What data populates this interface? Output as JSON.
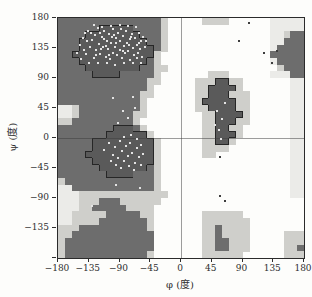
{
  "figure": {
    "kind": "Ramachandran plot (protein backbone dihedral angle map)"
  },
  "chart_data": {
    "type": "heatmap",
    "xlabel": "φ (度)",
    "ylabel": "ψ (度)",
    "xlim": [
      -180,
      180
    ],
    "ylim": [
      -180,
      180
    ],
    "cell_size_deg": 10,
    "xticks": [
      -180,
      -135,
      -90,
      -45,
      0,
      45,
      90,
      135,
      180
    ],
    "xtick_labels": [
      "−180",
      "−135",
      "−90",
      "−45",
      "0",
      "45",
      "90",
      "135",
      "180"
    ],
    "yticks": [
      180,
      135,
      90,
      45,
      0,
      -45,
      -90,
      -135,
      -180
    ],
    "ytick_labels": [
      "180",
      "135",
      "90",
      "45",
      "0",
      "−45",
      "−90",
      "−135",
      ""
    ],
    "grid": "zero-axis lines only",
    "axis_color": "#2b2b2b",
    "zero_line_color": "rgba(60,60,60,0.5)",
    "region_levels": {
      "c": {
        "name": "core-most-favoured",
        "color": "#5a5a5a",
        "outline": "#262626"
      },
      "d": {
        "name": "allowed",
        "color": "#6d6d6d"
      },
      "l": {
        "name": "generously-allowed",
        "color": "#cfcfcb"
      },
      "e": {
        "name": "marginal",
        "color": "#ebebe8"
      },
      ".": {
        "name": "disallowed",
        "color": "#fdfdfb"
      }
    },
    "region_map": [
      "dddddddddddddddl.....llll......eeeee",
      "ddddddcccccddddl...............eeeee",
      "ddddccccccccdddl...............eeldd",
      "dddccccccccccddl...............eeddd",
      "dddcccccccccccdl...............edddd",
      "ddccccccccccccl................ddddd",
      "dddccccccccccdl................edddd",
      "ddddccccccccddll................lddd",
      "dddddccccdddddl.......lll......eeedd",
      "dddddddddddddll.....lllccll.......ee",
      "dddddddddddddl......llccccl.......ee",
      "ddddddddddddll......llccclll......ee",
      "ddddddddddddl.......lcccccll......ee",
      "eeldddddddddl.......llccccll......ee",
      "eelddddddddll........llccccl......ee",
      "lldddddddddl.........llcccll......ee",
      "ddddddddcccdl........llccll.......ee",
      "dddddddccccccl.......llcccl.......ee",
      "dddddcccccccccl......llccl........ee",
      "dddddcccccccccl......llll.........ee",
      "ddddccccccccccl......ll...........ee",
      "dddddcccccccccl...................ee",
      "ddddddcccccccdl...................ee",
      "dddddddccccdddl...................ee",
      "ldddddddddddddl...................ee",
      "eeddddddddddddl...................ee",
      "eeelllllllllllll..................ee",
      "eeellldddllllll.....................",
      "eeelldddddllll......................",
      "eellllldddddll.......llllll.........",
      "eelllldddddddl.......lllllll........",
      "lllddddddddddl.......lldllll........",
      "lldddddddddddd.......lldllll.....lll",
      "lddddddddddddd.......llddlll.....lll",
      "lddddddddddddd.......llddlll.....lld",
      "lddddddddddddl.......llllll......lll"
    ],
    "points": {
      "marker_size_px": 2,
      "on_dark_color": "#e3e3e3",
      "on_light_color": "#3d3d3d",
      "on_dark": [
        [
          -152,
          128
        ],
        [
          -148,
          139
        ],
        [
          -143,
          150
        ],
        [
          -139,
          126
        ],
        [
          -136,
          160
        ],
        [
          -133,
          136
        ],
        [
          -130,
          147
        ],
        [
          -128,
          120
        ],
        [
          -126,
          154
        ],
        [
          -124,
          132
        ],
        [
          -122,
          165
        ],
        [
          -120,
          141
        ],
        [
          -118,
          126
        ],
        [
          -116,
          152
        ],
        [
          -114,
          136
        ],
        [
          -112,
          160
        ],
        [
          -110,
          122
        ],
        [
          -109,
          146
        ],
        [
          -107,
          133
        ],
        [
          -105,
          156
        ],
        [
          -104,
          118
        ],
        [
          -102,
          142
        ],
        [
          -100,
          128
        ],
        [
          -99,
          163
        ],
        [
          -97,
          137
        ],
        [
          -95,
          150
        ],
        [
          -94,
          124
        ],
        [
          -92,
          158
        ],
        [
          -90,
          132
        ],
        [
          -89,
          145
        ],
        [
          -87,
          120
        ],
        [
          -85,
          153
        ],
        [
          -84,
          138
        ],
        [
          -82,
          127
        ],
        [
          -80,
          161
        ],
        [
          -79,
          143
        ],
        [
          -77,
          131
        ],
        [
          -75,
          148
        ],
        [
          -74,
          117
        ],
        [
          -72,
          156
        ],
        [
          -70,
          135
        ],
        [
          -69,
          124
        ],
        [
          -67,
          150
        ],
        [
          -65,
          140
        ],
        [
          -63,
          128
        ],
        [
          -62,
          158
        ],
        [
          -60,
          133
        ],
        [
          -58,
          146
        ],
        [
          -57,
          121
        ],
        [
          -55,
          152
        ],
        [
          -66,
          166
        ],
        [
          -78,
          168
        ],
        [
          -90,
          170
        ],
        [
          -103,
          168
        ],
        [
          -115,
          166
        ],
        [
          -127,
          169
        ],
        [
          -140,
          157
        ],
        [
          -146,
          118
        ],
        [
          -134,
          112
        ],
        [
          -121,
          113
        ],
        [
          -108,
          112
        ],
        [
          -96,
          110
        ],
        [
          -83,
          112
        ],
        [
          -70,
          112
        ],
        [
          -58,
          113
        ],
        [
          -119,
          158
        ],
        [
          -98,
          155
        ],
        [
          -88,
          164
        ],
        [
          -76,
          140
        ],
        [
          -64,
          120
        ],
        [
          -110,
          138
        ],
        [
          -125,
          125
        ],
        [
          -95,
          142
        ],
        [
          -85,
          130
        ],
        [
          -73,
          152
        ],
        [
          -62,
          143
        ],
        [
          -53,
          136
        ],
        [
          -51,
          145
        ],
        [
          -142,
          132
        ],
        [
          -137,
          145
        ],
        [
          -131,
          158
        ],
        [
          -117,
          133
        ],
        [
          -113,
          148
        ],
        [
          -106,
          125
        ],
        [
          -101,
          152
        ],
        [
          -112,
          -18
        ],
        [
          -105,
          -8
        ],
        [
          -100,
          -25
        ],
        [
          -96,
          -14
        ],
        [
          -92,
          -30
        ],
        [
          -89,
          -5
        ],
        [
          -86,
          -20
        ],
        [
          -83,
          -35
        ],
        [
          -80,
          -12
        ],
        [
          -77,
          -27
        ],
        [
          -74,
          -8
        ],
        [
          -71,
          -22
        ],
        [
          -68,
          -38
        ],
        [
          -65,
          -15
        ],
        [
          -62,
          -28
        ],
        [
          -59,
          -10
        ],
        [
          -56,
          -24
        ],
        [
          -95,
          -40
        ],
        [
          -88,
          -45
        ],
        [
          -76,
          -42
        ],
        [
          -69,
          -48
        ],
        [
          -102,
          -35
        ],
        [
          -84,
          2
        ],
        [
          -73,
          5
        ],
        [
          -64,
          -2
        ],
        [
          -58,
          -40
        ],
        [
          -70,
          62
        ],
        [
          -85,
          40
        ],
        [
          -68,
          45
        ],
        [
          -100,
          60
        ],
        [
          -92,
          22
        ],
        [
          -78,
          30
        ],
        [
          -130,
          -102
        ],
        [
          -60,
          -75
        ],
        [
          -95,
          -70
        ],
        [
          52,
          40
        ],
        [
          60,
          28
        ],
        [
          56,
          12
        ],
        [
          65,
          52
        ],
        [
          58,
          -2
        ],
        [
          50,
          20
        ]
      ],
      "on_light": [
        [
          100,
          172
        ],
        [
          85,
          145
        ],
        [
          121,
          128
        ],
        [
          133,
          112
        ],
        [
          140,
          130
        ],
        [
          57,
          -28
        ],
        [
          57,
          -87
        ],
        [
          64,
          -94
        ]
      ]
    }
  }
}
